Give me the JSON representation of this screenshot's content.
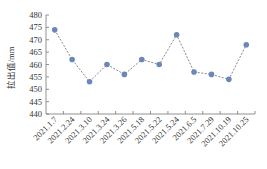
{
  "chart_data": {
    "type": "line",
    "title": "",
    "xlabel": "",
    "ylabel": "拉出值/mm",
    "categories": [
      "2021.1.7",
      "2021.2.24",
      "2021.3.10",
      "2021.3.24",
      "2021.3.26",
      "2021.5.18",
      "2021.5.22",
      "2021.5.24",
      "2021.6.5",
      "2021.7.29",
      "2021.10.19",
      "2021.10.25"
    ],
    "series": [
      {
        "name": "拉出值",
        "values": [
          474,
          462,
          453,
          460,
          456,
          462,
          460,
          472,
          457,
          456,
          454,
          468
        ]
      }
    ],
    "ylim": [
      440,
      480
    ],
    "yticks": [
      440,
      445,
      450,
      455,
      460,
      465,
      470,
      475,
      480
    ],
    "grid": false,
    "legend": null,
    "line_style": "dashed",
    "marker": "circle",
    "colors": {
      "marker": "#6b86b8",
      "line": "#555555",
      "axis": "#777777"
    }
  }
}
